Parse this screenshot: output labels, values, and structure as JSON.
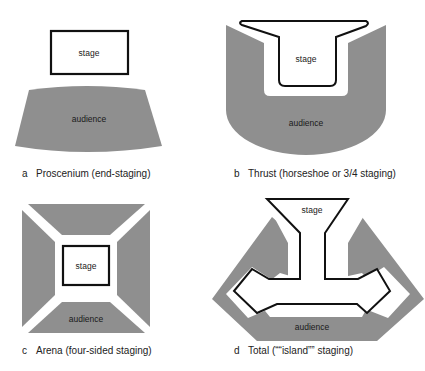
{
  "colors": {
    "audience_fill": "#8f8f8f",
    "stage_stroke": "#111111",
    "background": "#ffffff"
  },
  "panels": [
    {
      "id": "a",
      "letter": "a",
      "title": "Proscenium (end-staging)",
      "stage_label": "stage",
      "audience_label": "audience"
    },
    {
      "id": "b",
      "letter": "b",
      "title": "Thrust (horseshoe or 3/4 staging)",
      "stage_label": "stage",
      "audience_label": "audience"
    },
    {
      "id": "c",
      "letter": "c",
      "title": "Arena (four-sided staging)",
      "stage_label": "stage",
      "audience_label": "audience"
    },
    {
      "id": "d",
      "letter": "d",
      "title": "Total (““island”” staging)",
      "stage_label": "stage",
      "audience_label": "audience"
    }
  ]
}
